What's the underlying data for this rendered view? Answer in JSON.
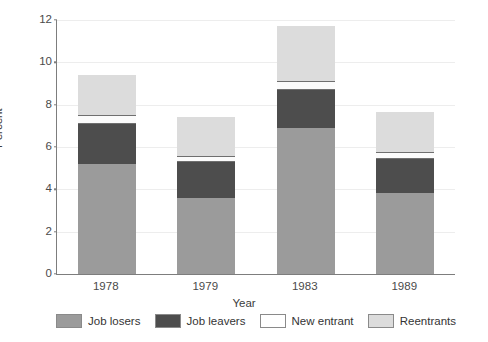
{
  "chart_data": {
    "type": "bar",
    "subtype": "stacked-bar",
    "title": "",
    "xlabel": "Year",
    "ylabel": "Percent",
    "categories": [
      "1978",
      "1979",
      "1983",
      "1989"
    ],
    "ylim": [
      0,
      12
    ],
    "yticks": [
      0,
      2,
      4,
      6,
      8,
      10,
      12
    ],
    "grid": true,
    "legend_position": "bottom",
    "series": [
      {
        "name": "Job losers",
        "color": "#9b9b9b",
        "values": [
          5.2,
          3.6,
          6.9,
          3.85
        ]
      },
      {
        "name": "Job leavers",
        "color": "#4d4d4d",
        "values": [
          1.9,
          1.7,
          1.8,
          1.6
        ]
      },
      {
        "name": "New entrant",
        "color": "#ffffff",
        "values": [
          0.4,
          0.3,
          0.4,
          0.3
        ]
      },
      {
        "name": "Reentrants",
        "color": "#dcdcdc",
        "values": [
          1.9,
          1.8,
          2.6,
          1.9
        ]
      }
    ],
    "totals": [
      9.4,
      7.4,
      11.7,
      7.65
    ]
  },
  "axes": {
    "y_title": "Percent",
    "x_title": "Year",
    "y_tick_labels": [
      "12",
      "10",
      "8",
      "6",
      "4",
      "2",
      "0"
    ],
    "x_tick_labels": [
      "1978",
      "1979",
      "1983",
      "1989"
    ]
  },
  "legend": {
    "items": [
      {
        "label": "Job losers",
        "swatch": "swatch-job-losers"
      },
      {
        "label": "Job leavers",
        "swatch": "swatch-job-leavers"
      },
      {
        "label": "New entrant",
        "swatch": "swatch-new-entrant"
      },
      {
        "label": "Reentrants",
        "swatch": "swatch-reentrants"
      }
    ]
  },
  "colors": {
    "job_losers": "#9b9b9b",
    "job_leavers": "#4d4d4d",
    "new_entrant": "#ffffff",
    "reentrants": "#dcdcdc",
    "axis": "#7d7d7d",
    "grid": "#ededed"
  },
  "title_strip": ""
}
